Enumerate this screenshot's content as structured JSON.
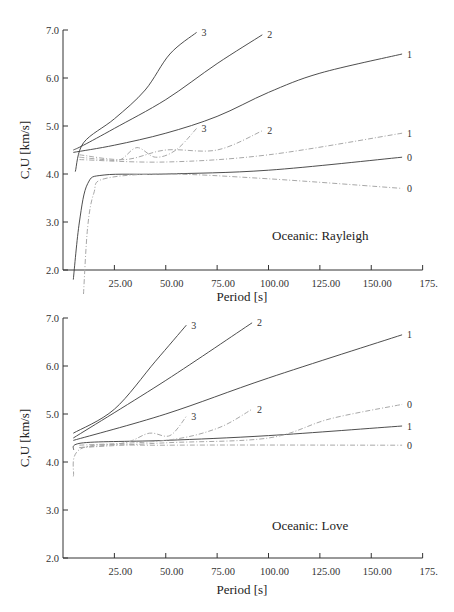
{
  "chart_data": [
    {
      "type": "line",
      "title": "Oceanic: Rayleigh",
      "annotation": "Oceanic: Rayleigh",
      "xlabel": "Period [s]",
      "ylabel": "C,U [km/s]",
      "xlim": [
        0,
        175
      ],
      "ylim": [
        2.0,
        7.0
      ],
      "x_ticks": [
        "25.00",
        "50.00",
        "75.00",
        "100.00",
        "125.00",
        "150.00",
        "175."
      ],
      "y_ticks": [
        "2.0",
        "3.0",
        "4.0",
        "5.0",
        "6.0",
        "7.0"
      ],
      "grid": false,
      "series": [
        {
          "name": "C mode 3",
          "style": "solid",
          "label": "3",
          "x": [
            6,
            10,
            25,
            40,
            52,
            65
          ],
          "y": [
            4.05,
            4.65,
            5.15,
            5.75,
            6.5,
            6.95
          ]
        },
        {
          "name": "C mode 2",
          "style": "solid",
          "label": "2",
          "x": [
            5,
            10,
            25,
            50,
            75,
            97
          ],
          "y": [
            4.5,
            4.6,
            4.95,
            5.55,
            6.3,
            6.9
          ]
        },
        {
          "name": "C mode 1",
          "style": "solid",
          "label": "1",
          "x": [
            5,
            25,
            50,
            75,
            100,
            125,
            165
          ],
          "y": [
            4.45,
            4.6,
            4.85,
            5.2,
            5.7,
            6.1,
            6.5
          ]
        },
        {
          "name": "C mode 0",
          "style": "solid",
          "label": "0",
          "x": [
            5,
            8,
            12,
            20,
            50,
            100,
            165
          ],
          "y": [
            1.8,
            3.0,
            3.8,
            3.98,
            4.0,
            4.08,
            4.35
          ]
        },
        {
          "name": "U mode 3",
          "style": "dashed",
          "label": "3",
          "x": [
            8,
            20,
            28,
            36,
            45,
            55,
            65
          ],
          "y": [
            4.35,
            4.3,
            4.3,
            4.55,
            4.35,
            4.5,
            4.95
          ]
        },
        {
          "name": "U mode 2",
          "style": "dashed",
          "label": "2",
          "x": [
            8,
            30,
            50,
            75,
            97
          ],
          "y": [
            4.4,
            4.3,
            4.5,
            4.5,
            4.9
          ]
        },
        {
          "name": "U mode 1",
          "style": "dashed",
          "label": "1",
          "x": [
            8,
            50,
            100,
            165
          ],
          "y": [
            4.3,
            4.25,
            4.4,
            4.85
          ]
        },
        {
          "name": "U mode 0",
          "style": "dashed",
          "label": "0",
          "x": [
            10,
            12,
            15,
            20,
            50,
            100,
            165
          ],
          "y": [
            1.5,
            2.9,
            3.6,
            3.9,
            4.0,
            3.9,
            3.7
          ]
        }
      ]
    },
    {
      "type": "line",
      "title": "Oceanic: Love",
      "annotation": "Oceanic: Love",
      "xlabel": "Period [s]",
      "ylabel": "C,U [km/s]",
      "xlim": [
        0,
        175
      ],
      "ylim": [
        2.0,
        7.0
      ],
      "x_ticks": [
        "25.00",
        "50.00",
        "75.00",
        "100.00",
        "125.00",
        "150.00",
        "175."
      ],
      "y_ticks": [
        "2.0",
        "3.0",
        "4.0",
        "5.0",
        "6.0",
        "7.0"
      ],
      "grid": false,
      "series": [
        {
          "name": "C mode 3",
          "style": "solid",
          "label": "3",
          "x": [
            5,
            25,
            45,
            60
          ],
          "y": [
            4.6,
            5.1,
            6.1,
            6.85
          ]
        },
        {
          "name": "C mode 2",
          "style": "solid",
          "label": "2",
          "x": [
            5,
            50,
            92
          ],
          "y": [
            4.5,
            5.7,
            6.9
          ]
        },
        {
          "name": "C mode 1",
          "style": "solid",
          "label": "1",
          "x": [
            5,
            50,
            100,
            165
          ],
          "y": [
            4.45,
            5.0,
            5.75,
            6.65
          ]
        },
        {
          "name": "C mode 0",
          "style": "solid",
          "label": "1",
          "x": [
            5,
            10,
            50,
            100,
            165
          ],
          "y": [
            4.25,
            4.4,
            4.45,
            4.55,
            4.75
          ]
        },
        {
          "name": "U mode 3",
          "style": "dashed",
          "label": "3",
          "x": [
            8,
            30,
            42,
            52,
            60
          ],
          "y": [
            4.3,
            4.4,
            4.6,
            4.55,
            4.95
          ]
        },
        {
          "name": "U mode 2",
          "style": "dashed",
          "label": "2",
          "x": [
            8,
            50,
            75,
            92
          ],
          "y": [
            4.35,
            4.45,
            4.7,
            5.1
          ]
        },
        {
          "name": "U mode 1",
          "style": "dashed",
          "label": "0",
          "x": [
            8,
            50,
            100,
            130,
            165
          ],
          "y": [
            4.3,
            4.4,
            4.5,
            4.9,
            5.2
          ]
        },
        {
          "name": "U mode 0",
          "style": "dashed",
          "label": "0",
          "x": [
            5,
            10,
            50,
            165
          ],
          "y": [
            3.7,
            4.3,
            4.35,
            4.35
          ]
        }
      ]
    }
  ],
  "top": {
    "annotation": "Oceanic: Rayleigh",
    "xlabel": "Period [s]",
    "ylabel": "C,U [km/s]"
  },
  "bottom": {
    "annotation": "Oceanic: Love",
    "xlabel": "Period [s]",
    "ylabel": "C,U [km/s]"
  },
  "colors": {
    "solid": "#3a3a3a",
    "dashed": "#a8a8a8",
    "axis": "#333333"
  }
}
